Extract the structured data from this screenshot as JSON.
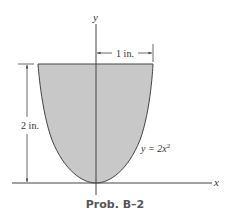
{
  "figure": {
    "caption": "Prob. B–2",
    "axes": {
      "x_label": "x",
      "y_label": "y"
    },
    "curve": {
      "equation_prefix": "y = 2x",
      "equation_exponent": "2",
      "equation": "y = 2x²"
    },
    "dimensions": {
      "width_label": "1 in.",
      "height_label": "2 in."
    },
    "colors": {
      "fill": "#c8c8c8",
      "stroke": "#444444",
      "background": "#ffffff"
    }
  }
}
